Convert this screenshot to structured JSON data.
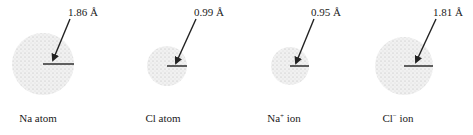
{
  "diagram": {
    "species": [
      {
        "id": "na-atom",
        "caption_base": "Na",
        "caption_charge": "",
        "caption_tail": " atom",
        "radius_label": "1.86 Å",
        "radius_angstrom": 1.86,
        "cx": 43,
        "cy": 64,
        "r": 31,
        "label_x": 68,
        "label_y": 6,
        "arrow_from": [
          70,
          19
        ],
        "arrow_to": [
          53,
          60
        ],
        "caption_x": 38
      },
      {
        "id": "cl-atom",
        "caption_base": "Cl",
        "caption_charge": "",
        "caption_tail": " atom",
        "radius_label": "0.99 Å",
        "radius_angstrom": 0.99,
        "cx": 167,
        "cy": 66,
        "r": 20,
        "label_x": 194,
        "label_y": 6,
        "arrow_from": [
          196,
          19
        ],
        "arrow_to": [
          176,
          63
        ],
        "caption_x": 163
      },
      {
        "id": "na-ion",
        "caption_base": "Na",
        "caption_charge": "+",
        "caption_tail": " ion",
        "radius_label": "0.95 Å",
        "radius_angstrom": 0.95,
        "cx": 290,
        "cy": 66,
        "r": 19,
        "label_x": 311,
        "label_y": 6,
        "arrow_from": [
          314,
          19
        ],
        "arrow_to": [
          296,
          63
        ],
        "caption_x": 284
      },
      {
        "id": "cl-ion",
        "caption_base": "Cl",
        "caption_charge": "−",
        "caption_tail": " ion",
        "radius_label": "1.81 Å",
        "radius_angstrom": 1.81,
        "cx": 404,
        "cy": 66,
        "r": 29,
        "label_x": 433,
        "label_y": 6,
        "arrow_from": [
          436,
          19
        ],
        "arrow_to": [
          416,
          62
        ],
        "caption_x": 398
      }
    ],
    "caption_y": 112,
    "colors": {
      "sphere_fill": "#ececec",
      "sphere_stipple": "#b8b8b8",
      "line": "#222222"
    }
  }
}
